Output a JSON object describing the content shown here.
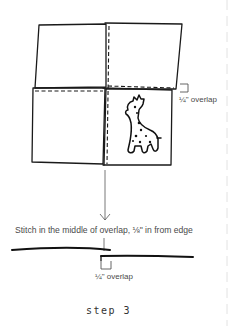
{
  "figure": {
    "top_annotation": {
      "overlap_label": "¼\" overlap"
    },
    "caption": "Stitch in the middle of overlap, ⅛\" in from edge",
    "bottom_annotation": {
      "overlap_label": "¼\" overlap"
    },
    "step_label": "step 3",
    "panels": [
      {
        "position": "top-left",
        "content": "blank fabric square"
      },
      {
        "position": "top-right",
        "content": "blank fabric square"
      },
      {
        "position": "bottom-left",
        "content": "blank fabric square"
      },
      {
        "position": "bottom-right",
        "content": "fabric square with spotted giraffe illustration"
      }
    ],
    "icons": [
      "down-arrow-icon",
      "giraffe-icon",
      "bracket-icon"
    ],
    "colors": {
      "ink": "#1a1a1a",
      "text": "#4a4a4a",
      "guide": "#dddddd",
      "background": "#ffffff"
    }
  }
}
